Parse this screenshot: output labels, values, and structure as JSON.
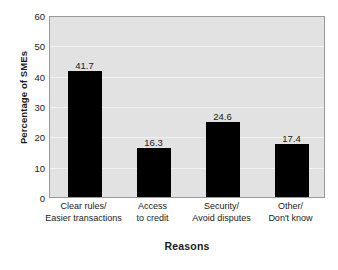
{
  "chart_data": {
    "type": "bar",
    "title": "",
    "subtitle": "",
    "xlabel": "Reasons",
    "ylabel": "Percentage of SMEs",
    "categories": [
      "Clear rules/ Easier transactions",
      "Access to credit",
      "Security/ Avoid disputes",
      "Other/ Don't know"
    ],
    "category_lines": [
      [
        "Clear rules/",
        "Easier transactions"
      ],
      [
        "Access",
        "to credit"
      ],
      [
        "Security/",
        "Avoid disputes"
      ],
      [
        "Other/",
        "Don't know"
      ]
    ],
    "values": [
      41.7,
      16.3,
      24.6,
      17.4
    ],
    "value_labels": [
      "41.7",
      "16.3",
      "24.6",
      "17.4"
    ],
    "ylim": [
      0,
      60
    ],
    "yticks": [
      0,
      10,
      20,
      30,
      40,
      50,
      60
    ],
    "ytick_labels": [
      "0",
      "10",
      "20",
      "30",
      "40",
      "50",
      "60"
    ],
    "grid": true,
    "legend": false,
    "legend_position": "none",
    "colors": {
      "bar": "#000000",
      "plot_background": "#e2e2e2",
      "gridline": "#f2f2f2",
      "frame": "#9a9a9a",
      "text": "#1a1a1a",
      "page_background": "#ffffff"
    }
  }
}
